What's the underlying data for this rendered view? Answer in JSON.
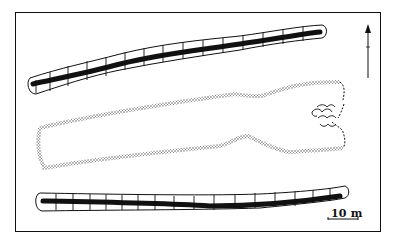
{
  "diagram": {
    "type": "archaeological-site-plan",
    "features": [
      {
        "name": "north-ditch",
        "kind": "ditch with hachured banks and dark fill"
      },
      {
        "name": "long-mound",
        "kind": "stippled earthen mound outline with broken (dashed) eastern end and stone structure"
      },
      {
        "name": "south-ditch",
        "kind": "ditch with hachured banks and dark fill"
      }
    ],
    "north_arrow": {
      "direction": "up"
    },
    "scale_bar": {
      "label": "10 m"
    },
    "colors": {
      "ink": "#111111",
      "background": "#ffffff",
      "stipple": "#555555"
    }
  }
}
